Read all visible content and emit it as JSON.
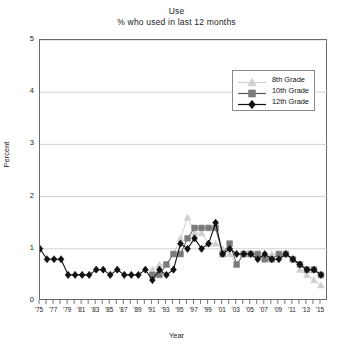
{
  "chart_data": {
    "type": "line",
    "title": "Use",
    "subtitle": "% who used in last 12 months",
    "xlabel": "Year",
    "ylabel": "Percent",
    "ylim": [
      0,
      5
    ],
    "yticks": [
      0,
      1,
      2,
      3,
      4,
      5
    ],
    "ytick_labels": [
      "0",
      "1",
      "2",
      "3",
      "4",
      "5"
    ],
    "xlim": [
      1975,
      2016
    ],
    "xtick_labels": [
      "'75",
      "'77",
      "'79",
      "'81",
      "'83",
      "'85",
      "'87",
      "'89",
      "'91",
      "'93",
      "'95",
      "'97",
      "'99",
      "'01",
      "'03",
      "'05",
      "'07",
      "'09",
      "'11",
      "'13",
      "'15"
    ],
    "xtick_years": [
      1975,
      1977,
      1979,
      1981,
      1983,
      1985,
      1987,
      1989,
      1991,
      1993,
      1995,
      1997,
      1999,
      2001,
      2003,
      2005,
      2007,
      2009,
      2011,
      2013,
      2015
    ],
    "grid": "horizontal",
    "legend_position": "upper right",
    "series": [
      {
        "name": "8th Grade",
        "color": "#cfcfcf",
        "marker": "triangle",
        "x": [
          1991,
          1992,
          1993,
          1994,
          1995,
          1996,
          1997,
          1998,
          1999,
          2000,
          2001,
          2002,
          2003,
          2004,
          2005,
          2006,
          2007,
          2008,
          2009,
          2010,
          2011,
          2012,
          2013,
          2014,
          2015
        ],
        "values": [
          0.6,
          0.7,
          0.7,
          0.9,
          1.2,
          1.6,
          1.3,
          1.3,
          1.1,
          1.1,
          1.0,
          0.9,
          0.7,
          0.9,
          0.9,
          0.9,
          0.8,
          0.9,
          0.9,
          0.9,
          0.8,
          0.6,
          0.5,
          0.4,
          0.3
        ]
      },
      {
        "name": "10th Grade",
        "color": "#7b7b7b",
        "marker": "square",
        "x": [
          1991,
          1992,
          1993,
          1994,
          1995,
          1996,
          1997,
          1998,
          1999,
          2000,
          2001,
          2002,
          2003,
          2004,
          2005,
          2006,
          2007,
          2008,
          2009,
          2010,
          2011,
          2012,
          2013,
          2014,
          2015
        ],
        "values": [
          0.5,
          0.5,
          0.7,
          0.9,
          0.9,
          1.2,
          1.4,
          1.4,
          1.4,
          1.4,
          0.9,
          1.1,
          0.7,
          0.9,
          0.9,
          0.9,
          0.8,
          0.8,
          0.9,
          0.9,
          0.8,
          0.7,
          0.6,
          0.6,
          0.5
        ]
      },
      {
        "name": "12th Grade",
        "color": "#111111",
        "marker": "diamond",
        "x": [
          1975,
          1976,
          1977,
          1978,
          1979,
          1980,
          1981,
          1982,
          1983,
          1984,
          1985,
          1986,
          1987,
          1988,
          1989,
          1990,
          1991,
          1992,
          1993,
          1994,
          1995,
          1996,
          1997,
          1998,
          1999,
          2000,
          2001,
          2002,
          2003,
          2004,
          2005,
          2006,
          2007,
          2008,
          2009,
          2010,
          2011,
          2012,
          2013,
          2014,
          2015
        ],
        "values": [
          1.0,
          0.8,
          0.8,
          0.8,
          0.5,
          0.5,
          0.5,
          0.5,
          0.6,
          0.6,
          0.5,
          0.6,
          0.5,
          0.5,
          0.5,
          0.6,
          0.4,
          0.6,
          0.5,
          0.6,
          1.1,
          1.0,
          1.2,
          1.0,
          1.1,
          1.5,
          0.9,
          1.0,
          0.9,
          0.9,
          0.9,
          0.8,
          0.9,
          0.8,
          0.8,
          0.9,
          0.8,
          0.7,
          0.6,
          0.6,
          0.5
        ]
      }
    ]
  }
}
